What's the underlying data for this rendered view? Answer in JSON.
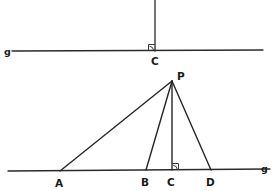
{
  "figure": {
    "canvas": {
      "width": 273,
      "height": 191
    },
    "colors": {
      "background": "#ffffff",
      "stroke": "#2b2b2b",
      "ray_stroke": "#262626",
      "label": "#1a1a1a",
      "arc": "#3a3a3a"
    }
  },
  "top_figure": {
    "line_g": {
      "label": "g",
      "label_x": 7,
      "label_y": 54,
      "x1": 12,
      "y1": 51,
      "x2": 263,
      "y2": 50
    },
    "perpendicular": {
      "x1": 155,
      "y1": 0,
      "x2": 155,
      "y2": 51
    },
    "foot_point": {
      "label": "C",
      "x": 155,
      "y": 51,
      "label_x": 152,
      "label_y": 64
    },
    "right_angle": {
      "marker": "square-arc",
      "x": 155,
      "y": 51,
      "size": 7
    }
  },
  "bottom_figure": {
    "line_g": {
      "label": "g",
      "label_x": 262,
      "label_y": 172,
      "x1": 8,
      "y1": 171,
      "x2": 270,
      "y2": 169
    },
    "apex": {
      "label": "P",
      "x": 172,
      "y": 81,
      "label_x": 177,
      "label_y": 79
    },
    "base_points": [
      {
        "label": "A",
        "x": 60,
        "y": 171,
        "label_x": 56,
        "label_y": 186
      },
      {
        "label": "B",
        "x": 146,
        "y": 170,
        "label_x": 142,
        "label_y": 185
      },
      {
        "label": "C",
        "x": 172,
        "y": 170,
        "label_x": 168,
        "label_y": 185
      },
      {
        "label": "D",
        "x": 211,
        "y": 170,
        "label_x": 207,
        "label_y": 185
      }
    ],
    "rays": [
      {
        "name": "PA",
        "x1": 172,
        "y1": 81,
        "x2": 60,
        "y2": 171
      },
      {
        "name": "PB",
        "x1": 172,
        "y1": 81,
        "x2": 146,
        "y2": 170
      },
      {
        "name": "PC",
        "x1": 172,
        "y1": 81,
        "x2": 172,
        "y2": 170
      },
      {
        "name": "PD",
        "x1": 172,
        "y1": 81,
        "x2": 211,
        "y2": 170
      }
    ],
    "right_angle": {
      "marker": "square-arc",
      "x": 172,
      "y": 170,
      "size": 7
    }
  }
}
